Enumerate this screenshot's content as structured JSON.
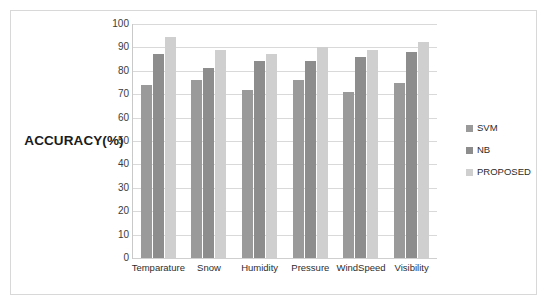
{
  "chart_data": {
    "type": "bar",
    "title": "",
    "xlabel": "",
    "ylabel": "ACCURACY(%)",
    "ylim": [
      0,
      100
    ],
    "ytick_step": 10,
    "yticks": [
      "100",
      "90",
      "80",
      "70",
      "60",
      "50",
      "40",
      "30",
      "20",
      "10",
      "0"
    ],
    "grid": true,
    "legend_position": "right",
    "categories": [
      "Temparature",
      "Snow",
      "Humidity",
      "Pressure",
      "WindSpeed",
      "Visibility"
    ],
    "series": [
      {
        "name": "SVM",
        "color": "#9a9a9a",
        "values": [
          74,
          76,
          72,
          76,
          71,
          75
        ]
      },
      {
        "name": "NB",
        "color": "#8d8d8d",
        "values": [
          87,
          81,
          84,
          84,
          86,
          88
        ]
      },
      {
        "name": "PROPOSED",
        "color": "#cfcfcf",
        "values": [
          94.5,
          89,
          87,
          90,
          89,
          92.5
        ]
      }
    ]
  },
  "figure": {
    "background_color": "#ffffff",
    "frame_color": "#d8d8d8",
    "gridline_color": "#d9d9d9"
  }
}
